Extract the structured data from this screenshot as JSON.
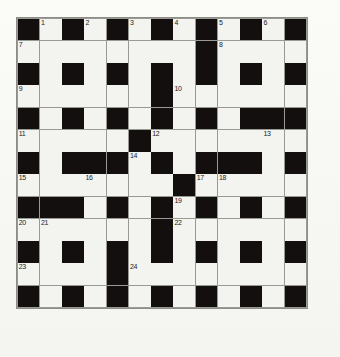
{
  "puzzle": {
    "type": "crossword-grid",
    "columns": 13,
    "rows": 13,
    "colors": {
      "page_background": "#f8f8f5",
      "white_cell": "#f3f3ef",
      "black_cell": "#120f0e",
      "grid_line": "#9a9a95",
      "number_text": "#1b1b1b"
    },
    "legend": {
      "W": "white answer cell",
      "B": "black blocked cell"
    },
    "grid": [
      [
        "B",
        "W",
        "B",
        "W",
        "B",
        "W",
        "B",
        "W",
        "B",
        "W",
        "B",
        "W",
        "B"
      ],
      [
        "W",
        "W",
        "W",
        "W",
        "W",
        "W",
        "W",
        "W",
        "B",
        "W",
        "W",
        "W",
        "W"
      ],
      [
        "B",
        "W",
        "B",
        "W",
        "B",
        "W",
        "B",
        "W",
        "B",
        "W",
        "B",
        "W",
        "B"
      ],
      [
        "W",
        "W",
        "W",
        "W",
        "W",
        "W",
        "B",
        "W",
        "W",
        "W",
        "W",
        "W",
        "W"
      ],
      [
        "B",
        "W",
        "B",
        "W",
        "B",
        "W",
        "B",
        "W",
        "B",
        "W",
        "B",
        "B",
        "B"
      ],
      [
        "W",
        "W",
        "W",
        "W",
        "W",
        "B",
        "W",
        "W",
        "W",
        "W",
        "W",
        "W",
        "W"
      ],
      [
        "B",
        "W",
        "B",
        "B",
        "B",
        "W",
        "B",
        "W",
        "B",
        "B",
        "B",
        "W",
        "B"
      ],
      [
        "W",
        "W",
        "W",
        "W",
        "W",
        "W",
        "W",
        "B",
        "W",
        "W",
        "W",
        "W",
        "W"
      ],
      [
        "B",
        "B",
        "B",
        "W",
        "B",
        "W",
        "B",
        "W",
        "B",
        "W",
        "B",
        "W",
        "B"
      ],
      [
        "W",
        "W",
        "W",
        "W",
        "W",
        "W",
        "B",
        "W",
        "W",
        "W",
        "W",
        "W",
        "W"
      ],
      [
        "B",
        "W",
        "B",
        "W",
        "B",
        "W",
        "B",
        "W",
        "B",
        "W",
        "B",
        "W",
        "B"
      ],
      [
        "W",
        "W",
        "W",
        "W",
        "B",
        "W",
        "W",
        "W",
        "W",
        "W",
        "W",
        "W",
        "W"
      ],
      [
        "B",
        "W",
        "B",
        "W",
        "B",
        "W",
        "B",
        "W",
        "B",
        "W",
        "B",
        "W",
        "B"
      ]
    ],
    "numbers": [
      {
        "number": "1",
        "row": 1,
        "col": 2
      },
      {
        "number": "2",
        "row": 1,
        "col": 4
      },
      {
        "number": "3",
        "row": 1,
        "col": 6
      },
      {
        "number": "4",
        "row": 1,
        "col": 8
      },
      {
        "number": "5",
        "row": 1,
        "col": 10
      },
      {
        "number": "6",
        "row": 1,
        "col": 12
      },
      {
        "number": "7",
        "row": 2,
        "col": 1
      },
      {
        "number": "8",
        "row": 2,
        "col": 10
      },
      {
        "number": "9",
        "row": 4,
        "col": 1
      },
      {
        "number": "10",
        "row": 4,
        "col": 8
      },
      {
        "number": "11",
        "row": 6,
        "col": 1
      },
      {
        "number": "12",
        "row": 6,
        "col": 7
      },
      {
        "number": "13",
        "row": 6,
        "col": 12
      },
      {
        "number": "14",
        "row": 7,
        "col": 6
      },
      {
        "number": "15",
        "row": 8,
        "col": 1
      },
      {
        "number": "16",
        "row": 8,
        "col": 4
      },
      {
        "number": "17",
        "row": 8,
        "col": 9
      },
      {
        "number": "18",
        "row": 8,
        "col": 10
      },
      {
        "number": "19",
        "row": 9,
        "col": 8
      },
      {
        "number": "20",
        "row": 10,
        "col": 1
      },
      {
        "number": "21",
        "row": 10,
        "col": 2
      },
      {
        "number": "22",
        "row": 10,
        "col": 8
      },
      {
        "number": "23",
        "row": 12,
        "col": 1
      },
      {
        "number": "24",
        "row": 12,
        "col": 6
      }
    ]
  }
}
